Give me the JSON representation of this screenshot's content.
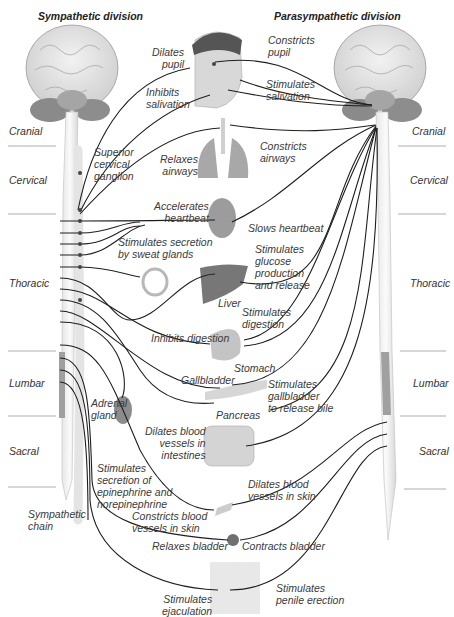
{
  "titles": {
    "sympathetic": "Sympathetic division",
    "parasympathetic": "Parasympathetic division"
  },
  "regions": {
    "left": [
      "Cranial",
      "Cervical",
      "Thoracic",
      "Lumbar",
      "Sacral"
    ],
    "right": [
      "Cranial",
      "Cervical",
      "Thoracic",
      "Lumbar",
      "Sacral"
    ]
  },
  "sympathetic_effects": [
    "Dilates\npupil",
    "Inhibits\nsalivation",
    "Relaxes\nairways",
    "Accelerates\nheartbeat",
    "Stimulates secretion\nby sweat glands",
    "Inhibits digestion",
    "Stimulates\nsecretion of\nepinephrine and\nnorepinephrine",
    "Dilates blood\nvessels in\nintestines",
    "Constricts blood\nvessels in skin",
    "Relaxes bladder",
    "Stimulates\nejaculation"
  ],
  "parasympathetic_effects": [
    "Constricts\npupil",
    "Stimulates\nsalivation",
    "Constricts\nairways",
    "Slows heartbeat",
    "Stimulates\nglucose\nproduction\nand release",
    "Stimulates\ndigestion",
    "Stimulates\ngallbladder\nto release bile",
    "Dilates blood\nvessels in skin",
    "Contracts bladder",
    "Stimulates\npenile erection"
  ],
  "structures": {
    "ganglion": "Superior\ncervical\nganglion",
    "liver": "Liver",
    "stomach": "Stomach",
    "gallbladder": "Gallbladder",
    "pancreas": "Pancreas",
    "adrenal": "Adrenal\ngland",
    "chain": "Sympathetic\nchain"
  },
  "colors": {
    "nerve": "#1e1e1e",
    "organ_gray": "#b5b5b5",
    "organ_dark": "#7d7d7d",
    "lumbar_band": "#9a9a9a",
    "text": "#3a3a3a"
  }
}
